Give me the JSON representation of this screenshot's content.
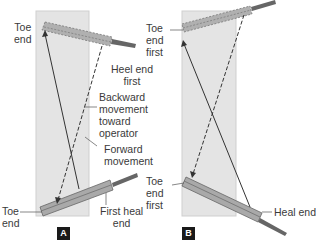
{
  "panels": [
    {
      "badge": "A",
      "labels": {
        "toe_end_top": "Toe\nend",
        "heel_end_first": "Heel end\nfirst",
        "backward": "Backward\nmovement\ntoward\noperator",
        "forward": "Forward\nmovement",
        "toe_end_bottom": "Toe\nend",
        "first_heal_end": "First heal\nend"
      }
    },
    {
      "badge": "B",
      "labels": {
        "toe_end_first_top": "Toe\nend\nfirst",
        "toe_end_first_bottom": "Toe\nend\nfirst",
        "heal_end": "Heal end"
      }
    }
  ],
  "colors": {
    "panel_bg": "#e4e4e4",
    "blade": "#a9a9a9",
    "handle": "#707070",
    "arrow": "#333333"
  }
}
